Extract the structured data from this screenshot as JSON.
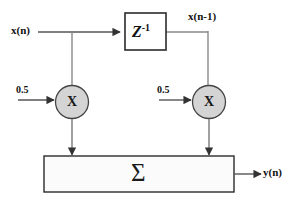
{
  "diagram": {
    "type": "signal-flow-block-diagram",
    "colors": {
      "line": "#555555",
      "stroke": "#333333",
      "multiplier_fill": "#d4d4d4",
      "sum_fill": "#fbfbfb",
      "text": "#111111",
      "background": "#ffffff"
    },
    "labels": {
      "input": "x(n)",
      "delayed_input": "x(n-1)",
      "output": "y(n)",
      "coefficient_left": "0.5",
      "coefficient_right": "0.5"
    },
    "blocks": {
      "delay": {
        "label": "Z",
        "exponent": "-1",
        "name": "unit-delay"
      },
      "multiplier_left": {
        "label": "X",
        "name": "multiplier"
      },
      "multiplier_right": {
        "label": "X",
        "name": "multiplier"
      },
      "summer": {
        "label": "Σ",
        "name": "summation"
      }
    }
  }
}
